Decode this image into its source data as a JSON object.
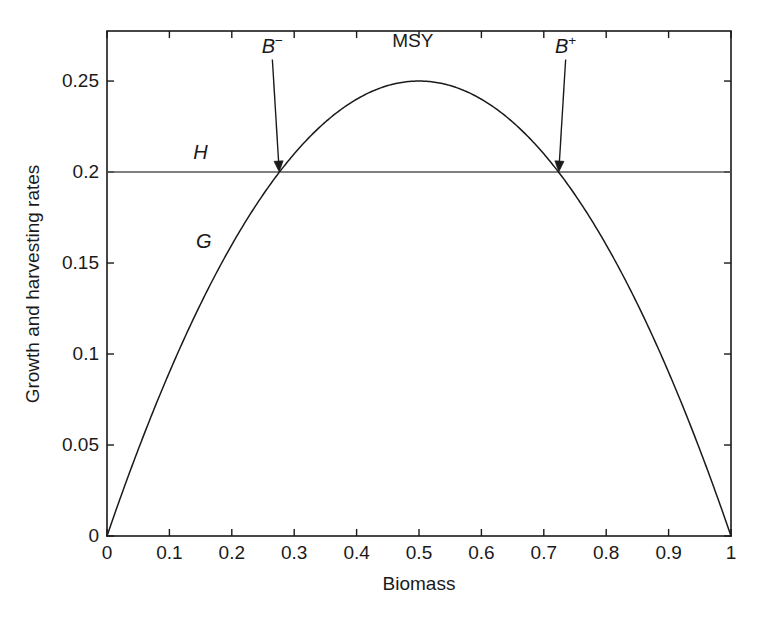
{
  "chart_data": {
    "type": "line",
    "title": "",
    "xlabel": "Biomass",
    "ylabel": "Growth and harvesting rates",
    "xlim": [
      0,
      1.0
    ],
    "ylim": [
      0,
      0.2775
    ],
    "xticks": [
      "0",
      "0.1",
      "0.2",
      "0.3",
      "0.4",
      "0.5",
      "0.6",
      "0.7",
      "0.8",
      "0.9",
      "1"
    ],
    "xtick_values": [
      0,
      0.1,
      0.2,
      0.3,
      0.4,
      0.5,
      0.6,
      0.7,
      0.8,
      0.9,
      1.0
    ],
    "yticks": [
      "0",
      "0.05",
      "0.1",
      "0.15",
      "0.2",
      "0.25"
    ],
    "ytick_values": [
      0,
      0.05,
      0.1,
      0.15,
      0.2,
      0.25
    ],
    "grid": false,
    "legend_position": "none",
    "series": [
      {
        "name": "G",
        "kind": "parabola",
        "description": "Logistic growth curve G(B) = B(1-B)",
        "x": [
          0,
          0.05,
          0.1,
          0.15,
          0.2,
          0.25,
          0.3,
          0.35,
          0.4,
          0.45,
          0.5,
          0.55,
          0.6,
          0.65,
          0.7,
          0.75,
          0.8,
          0.85,
          0.9,
          0.95,
          1.0
        ],
        "values": [
          0,
          0.0475,
          0.09,
          0.1275,
          0.16,
          0.1875,
          0.21,
          0.2275,
          0.24,
          0.2475,
          0.25,
          0.2475,
          0.24,
          0.2275,
          0.21,
          0.1875,
          0.16,
          0.1275,
          0.09,
          0.0475,
          0
        ]
      },
      {
        "name": "H",
        "kind": "horizontal-line",
        "description": "Constant harvesting rate H = 0.2",
        "x": [
          0,
          1.0
        ],
        "values": [
          0.2,
          0.2
        ]
      }
    ],
    "annotations": [
      {
        "id": "msy",
        "text": "MSY",
        "italic": false,
        "x": 0.49,
        "y": 0.272,
        "note": "maximum sustainable yield at the curve peak"
      },
      {
        "id": "h-label",
        "text": "H",
        "italic": true,
        "x": 0.15,
        "y": 0.211,
        "note": "harvesting rate curve label"
      },
      {
        "id": "g-label",
        "text": "G",
        "italic": true,
        "x": 0.155,
        "y": 0.162,
        "note": "growth curve label"
      },
      {
        "id": "b-minus",
        "text": "B",
        "sup": "−",
        "italic": true,
        "x": 0.265,
        "y": 0.2695,
        "arrow_to_x": 0.276,
        "arrow_to_y": 0.2,
        "note": "lower equilibrium biomass"
      },
      {
        "id": "b-plus",
        "text": "B",
        "sup": "+",
        "italic": true,
        "x": 0.735,
        "y": 0.2695,
        "arrow_to_x": 0.724,
        "arrow_to_y": 0.2,
        "note": "upper equilibrium biomass"
      }
    ],
    "intersections": {
      "b_minus": 0.2764,
      "b_plus": 0.7236,
      "msy_x": 0.5,
      "msy_y": 0.25,
      "h_level": 0.2
    },
    "colors": {
      "axis": "#1a1a1a",
      "curve": "#1a1a1a",
      "harvest_line": "#555555",
      "background": "#ffffff"
    }
  },
  "caption": {
    "partial_text": ""
  }
}
